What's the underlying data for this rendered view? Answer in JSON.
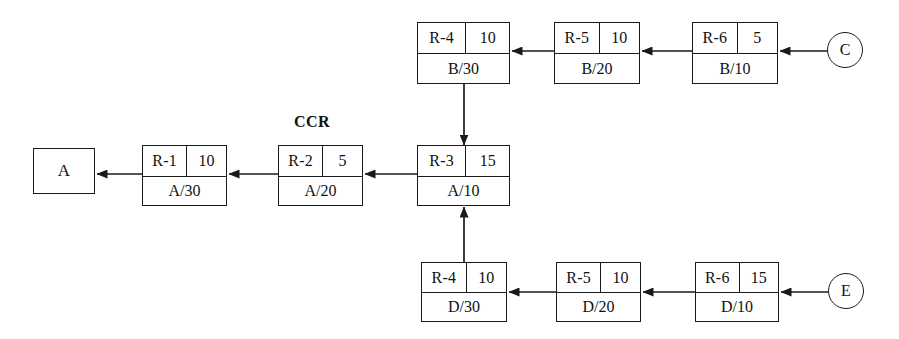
{
  "diagram": {
    "annotations": [
      {
        "id": "ccr",
        "text": "CCR",
        "x": 312,
        "y": 122
      }
    ],
    "terminals": [
      {
        "id": "A",
        "label": "A",
        "shape": "square",
        "x": 33,
        "y": 148,
        "w": 62,
        "h": 46
      },
      {
        "id": "C",
        "label": "C",
        "shape": "circle",
        "cx": 845,
        "cy": 50,
        "r": 18
      },
      {
        "id": "E",
        "label": "E",
        "shape": "circle",
        "cx": 846,
        "cy": 291,
        "r": 18
      }
    ],
    "nodes": [
      {
        "id": "b-r4",
        "resource": "R-4",
        "capacity": "10",
        "part": "B/30",
        "x": 417,
        "y": 22,
        "w": 93,
        "h": 62
      },
      {
        "id": "b-r5",
        "resource": "R-5",
        "capacity": "10",
        "part": "B/20",
        "x": 554,
        "y": 22,
        "w": 86,
        "h": 62
      },
      {
        "id": "b-r6",
        "resource": "R-6",
        "capacity": "5",
        "part": "B/10",
        "x": 692,
        "y": 22,
        "w": 86,
        "h": 62
      },
      {
        "id": "a-r1",
        "resource": "R-1",
        "capacity": "10",
        "part": "A/30",
        "x": 142,
        "y": 145,
        "w": 85,
        "h": 61
      },
      {
        "id": "a-r2",
        "resource": "R-2",
        "capacity": "5",
        "part": "A/20",
        "x": 278,
        "y": 145,
        "w": 85,
        "h": 61
      },
      {
        "id": "a-r3",
        "resource": "R-3",
        "capacity": "15",
        "part": "A/10",
        "x": 417,
        "y": 145,
        "w": 93,
        "h": 61
      },
      {
        "id": "d-r4",
        "resource": "R-4",
        "capacity": "10",
        "part": "D/30",
        "x": 421,
        "y": 262,
        "w": 86,
        "h": 60
      },
      {
        "id": "d-r5",
        "resource": "R-5",
        "capacity": "10",
        "part": "D/20",
        "x": 556,
        "y": 262,
        "w": 85,
        "h": 60
      },
      {
        "id": "d-r6",
        "resource": "R-6",
        "capacity": "15",
        "part": "D/10",
        "x": 695,
        "y": 262,
        "w": 84,
        "h": 60
      }
    ],
    "arrows": [
      {
        "id": "c-to-br6",
        "from": "C",
        "to": "b-r6",
        "dir": "left",
        "x1": 827,
        "y1": 51,
        "x2": 780,
        "y2": 51
      },
      {
        "id": "br6-to-br5",
        "from": "b-r6",
        "to": "b-r5",
        "dir": "left",
        "x1": 692,
        "y1": 51,
        "x2": 642,
        "y2": 51
      },
      {
        "id": "br5-to-br4",
        "from": "b-r5",
        "to": "b-r4",
        "dir": "left",
        "x1": 554,
        "y1": 51,
        "x2": 512,
        "y2": 51
      },
      {
        "id": "br4-to-ar3",
        "from": "b-r4",
        "to": "a-r3",
        "dir": "down",
        "x1": 464,
        "y1": 84,
        "x2": 464,
        "y2": 145
      },
      {
        "id": "e-to-dr6",
        "from": "E",
        "to": "d-r6",
        "dir": "left",
        "x1": 828,
        "y1": 292,
        "x2": 781,
        "y2": 292
      },
      {
        "id": "dr6-to-dr5",
        "from": "d-r6",
        "to": "d-r5",
        "dir": "left",
        "x1": 695,
        "y1": 292,
        "x2": 643,
        "y2": 292
      },
      {
        "id": "dr5-to-dr4",
        "from": "d-r5",
        "to": "d-r4",
        "dir": "left",
        "x1": 556,
        "y1": 292,
        "x2": 509,
        "y2": 292
      },
      {
        "id": "dr4-to-ar3",
        "from": "d-r4",
        "to": "a-r3",
        "dir": "up",
        "x1": 464,
        "y1": 262,
        "x2": 464,
        "y2": 207
      },
      {
        "id": "ar3-to-ar2",
        "from": "a-r3",
        "to": "a-r2",
        "dir": "left",
        "x1": 417,
        "y1": 174,
        "x2": 365,
        "y2": 174
      },
      {
        "id": "ar2-to-ar1",
        "from": "a-r2",
        "to": "a-r1",
        "dir": "left",
        "x1": 278,
        "y1": 174,
        "x2": 229,
        "y2": 174
      },
      {
        "id": "ar1-to-a",
        "from": "a-r1",
        "to": "A",
        "dir": "left",
        "x1": 142,
        "y1": 174,
        "x2": 97,
        "y2": 174
      }
    ],
    "style": {
      "line_color": "#1a1a1a",
      "background": "#ffffff",
      "text_color": "#111111"
    }
  }
}
